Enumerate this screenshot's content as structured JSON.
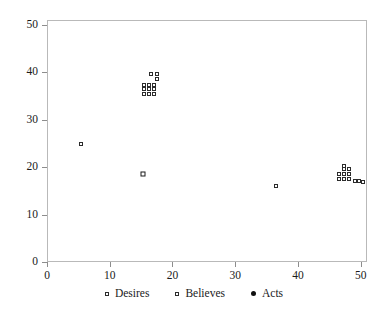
{
  "chart_data": {
    "type": "scatter",
    "title": "",
    "xlabel": "",
    "ylabel": "",
    "xlim": [
      0,
      51
    ],
    "ylim": [
      0,
      51
    ],
    "xticks": [
      0,
      10,
      20,
      30,
      40,
      50
    ],
    "yticks": [
      0,
      10,
      20,
      30,
      40,
      50
    ],
    "xticklabels": [
      "0",
      "10",
      "20",
      "30",
      "40",
      "50"
    ],
    "yticklabels": [
      "0",
      "10",
      "20",
      "30",
      "40",
      "50"
    ],
    "grid": false,
    "legend_position": "bottom",
    "frame": true,
    "series": [
      {
        "name": "Desires",
        "marker": "open-square-bold",
        "color": "#1a1a1a",
        "points": [
          {
            "x": 15.1,
            "y": 18.7
          }
        ]
      },
      {
        "name": "Believes",
        "marker": "open-square",
        "color": "#2b2b2b",
        "points": [
          {
            "x": 5.2,
            "y": 25.0
          },
          {
            "x": 15.3,
            "y": 37.6
          },
          {
            "x": 16.1,
            "y": 37.6
          },
          {
            "x": 15.3,
            "y": 36.6
          },
          {
            "x": 16.1,
            "y": 36.6
          },
          {
            "x": 15.3,
            "y": 35.6
          },
          {
            "x": 16.1,
            "y": 35.6
          },
          {
            "x": 16.9,
            "y": 35.6
          },
          {
            "x": 16.9,
            "y": 36.6
          },
          {
            "x": 16.9,
            "y": 37.6
          },
          {
            "x": 16.4,
            "y": 39.9
          },
          {
            "x": 17.3,
            "y": 39.9
          },
          {
            "x": 17.4,
            "y": 38.8
          },
          {
            "x": 36.3,
            "y": 16.3
          },
          {
            "x": 46.3,
            "y": 18.8
          },
          {
            "x": 47.1,
            "y": 18.8
          },
          {
            "x": 47.9,
            "y": 18.8
          },
          {
            "x": 46.3,
            "y": 17.8
          },
          {
            "x": 47.1,
            "y": 17.8
          },
          {
            "x": 47.9,
            "y": 17.8
          },
          {
            "x": 47.1,
            "y": 19.9
          },
          {
            "x": 47.9,
            "y": 19.9
          },
          {
            "x": 47.2,
            "y": 20.5
          },
          {
            "x": 48.9,
            "y": 17.2
          },
          {
            "x": 49.6,
            "y": 17.2
          },
          {
            "x": 50.2,
            "y": 17.0
          }
        ]
      },
      {
        "name": "Acts",
        "marker": "filled-circle",
        "color": "#101010",
        "points": []
      }
    ]
  },
  "legend": {
    "items": [
      {
        "label": "Desires",
        "marker": "open-square-icon"
      },
      {
        "label": "Believes",
        "marker": "open-square-icon"
      },
      {
        "label": "Acts",
        "marker": "filled-circle-icon"
      }
    ]
  }
}
